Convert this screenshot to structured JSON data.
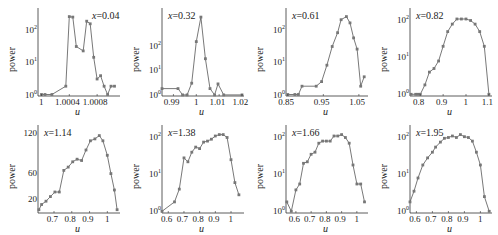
{
  "figure": {
    "ylabel": "power",
    "xlabel": "u",
    "line_color": "#555555",
    "marker_color": "#777777"
  },
  "chart_data": [
    {
      "type": "line",
      "title": "x=0.04",
      "annotation": "x=0.04",
      "xlabel": "u",
      "ylabel": "power",
      "yscale": "log",
      "xlim": [
        0.99995,
        1.0011
      ],
      "ylim": [
        0.9,
        300
      ],
      "xticks": [
        "1",
        "1.0004",
        "1.0008"
      ],
      "yticks": [
        "10^0",
        "10^1",
        "10^2"
      ],
      "x": [
        1.0,
        1.00005,
        1.00015,
        1.00035,
        1.0004,
        1.00045,
        1.0005,
        1.0006,
        1.00065,
        1.0007,
        1.00075,
        1.0008,
        1.00085,
        1.0009,
        1.00095,
        1.001,
        1.00105
      ],
      "y": [
        1.0,
        1.0,
        1.0,
        1.8,
        250,
        240,
        30,
        22,
        180,
        150,
        14,
        3,
        3.8,
        1.8,
        1.0,
        1.8,
        1.8
      ]
    },
    {
      "type": "line",
      "title": "x=0.32",
      "annotation": "x=0.32",
      "xlabel": "u",
      "ylabel": "power",
      "yscale": "log",
      "xlim": [
        0.985,
        1.02
      ],
      "ylim": [
        0.9,
        2000
      ],
      "xticks": [
        "0.99",
        "1",
        "1.01",
        "1.02"
      ],
      "yticks": [
        "10^0",
        "10^1",
        "10^2"
      ],
      "x": [
        0.985,
        0.992,
        0.994,
        0.996,
        0.998,
        1.0,
        1.002,
        1.004,
        1.006,
        1.008,
        1.0095,
        1.012,
        1.02
      ],
      "y": [
        1.8,
        1.8,
        1.0,
        1.0,
        3,
        150,
        1500,
        30,
        1.8,
        1.0,
        2.8,
        1.0,
        1.0
      ]
    },
    {
      "type": "line",
      "title": "x=0.61",
      "annotation": "x=0.61",
      "xlabel": "u",
      "ylabel": "power",
      "yscale": "log",
      "xlim": [
        0.845,
        1.07
      ],
      "ylim": [
        0.9,
        300
      ],
      "xticks": [
        "0.85",
        "0.95",
        "1.05"
      ],
      "yticks": [
        "10^0",
        "10^1",
        "10^2"
      ],
      "x": [
        0.85,
        0.87,
        0.88,
        0.89,
        0.93,
        0.945,
        0.96,
        0.975,
        0.99,
        1.0,
        1.015,
        1.025,
        1.035,
        1.045,
        1.055,
        1.065
      ],
      "y": [
        1.0,
        1.0,
        1.0,
        1.8,
        1.8,
        2.5,
        8,
        30,
        80,
        200,
        250,
        160,
        55,
        25,
        1.8,
        3.5
      ]
    },
    {
      "type": "line",
      "title": "x=0.82",
      "annotation": "x=0.82",
      "xlabel": "u",
      "ylabel": "power",
      "yscale": "log",
      "xlim": [
        0.755,
        1.105
      ],
      "ylim": [
        0.9,
        150
      ],
      "xticks": [
        "0.8",
        "0.9",
        "1",
        "1.1"
      ],
      "yticks": [
        "10^0",
        "10^1",
        "10^2"
      ],
      "x": [
        0.76,
        0.78,
        0.79,
        0.8,
        0.82,
        0.84,
        0.86,
        0.88,
        0.9,
        0.92,
        0.94,
        0.96,
        0.98,
        1.0,
        1.02,
        1.04,
        1.06,
        1.08,
        1.1
      ],
      "y": [
        1.0,
        1.0,
        1.0,
        1.0,
        1.8,
        4,
        5,
        8,
        20,
        50,
        80,
        110,
        110,
        110,
        100,
        80,
        50,
        20,
        1.0
      ]
    },
    {
      "type": "line",
      "title": "x=1.14",
      "annotation": "x=1.14",
      "xlabel": "u",
      "ylabel": "power",
      "yscale": "linear",
      "xlim": [
        0.61,
        1.06
      ],
      "ylim": [
        0,
        125
      ],
      "xticks": [
        "0.7",
        "0.8",
        "0.9",
        "1"
      ],
      "yticks": [
        "20",
        "60",
        "120"
      ],
      "x": [
        0.615,
        0.63,
        0.655,
        0.68,
        0.705,
        0.73,
        0.755,
        0.78,
        0.805,
        0.83,
        0.855,
        0.88,
        0.905,
        0.93,
        0.955,
        0.975,
        1.0,
        1.02,
        1.04,
        1.055
      ],
      "y": [
        5,
        13,
        18,
        25,
        32,
        32,
        65,
        70,
        78,
        82,
        80,
        96,
        110,
        113,
        118,
        110,
        88,
        60,
        35,
        5
      ]
    },
    {
      "type": "line",
      "title": "x=1.38",
      "annotation": "x=1.38",
      "xlabel": "u",
      "ylabel": "power",
      "yscale": "log",
      "xlim": [
        0.56,
        1.07
      ],
      "ylim": [
        0.9,
        150
      ],
      "xticks": [
        "0.6",
        "0.7",
        "0.8",
        "0.9",
        "1"
      ],
      "yticks": [
        "10^0",
        "10^1",
        "10^2"
      ],
      "x": [
        0.56,
        0.64,
        0.67,
        0.7,
        0.725,
        0.75,
        0.775,
        0.8,
        0.825,
        0.85,
        0.875,
        0.9,
        0.925,
        0.95,
        0.975,
        1.0,
        1.025,
        1.05
      ],
      "y": [
        1.0,
        1.8,
        4,
        28,
        22,
        40,
        55,
        50,
        75,
        80,
        90,
        110,
        120,
        120,
        100,
        25,
        6,
        2.8
      ]
    },
    {
      "type": "line",
      "title": "x=1.66",
      "annotation": "x=1.66",
      "xlabel": "u",
      "ylabel": "power",
      "yscale": "log",
      "xlim": [
        0.535,
        1.06
      ],
      "ylim": [
        0.9,
        150
      ],
      "xticks": [
        "0.6",
        "0.7",
        "0.8",
        "0.9",
        "1"
      ],
      "yticks": [
        "10^0",
        "10^1",
        "10^2"
      ],
      "x": [
        0.54,
        0.57,
        0.6,
        0.625,
        0.65,
        0.675,
        0.7,
        0.725,
        0.75,
        0.775,
        0.8,
        0.825,
        0.85,
        0.875,
        0.9,
        0.925,
        0.95,
        0.975,
        1.0,
        1.025,
        1.05
      ],
      "y": [
        1.8,
        1.0,
        3.8,
        5.5,
        20,
        22,
        35,
        40,
        70,
        80,
        80,
        80,
        110,
        110,
        120,
        100,
        70,
        18,
        5.5,
        5.5,
        1.8
      ]
    },
    {
      "type": "line",
      "title": "x=1.95",
      "annotation": "x=1.95",
      "xlabel": "u",
      "ylabel": "power",
      "yscale": "log",
      "xlim": [
        0.56,
        1.06
      ],
      "ylim": [
        0.9,
        150
      ],
      "xticks": [
        "0.6",
        "0.7",
        "0.8",
        "0.9",
        "1"
      ],
      "yticks": [
        "10^0",
        "10^1",
        "10^2"
      ],
      "x": [
        0.56,
        0.585,
        0.61,
        0.64,
        0.67,
        0.7,
        0.72,
        0.75,
        0.775,
        0.8,
        0.825,
        0.85,
        0.875,
        0.9,
        0.925,
        0.95,
        0.975,
        1.0,
        1.025,
        1.055
      ],
      "y": [
        1.8,
        3.5,
        8,
        18,
        28,
        40,
        55,
        75,
        95,
        100,
        110,
        100,
        120,
        105,
        100,
        80,
        40,
        18,
        2.5,
        1.0
      ]
    }
  ]
}
